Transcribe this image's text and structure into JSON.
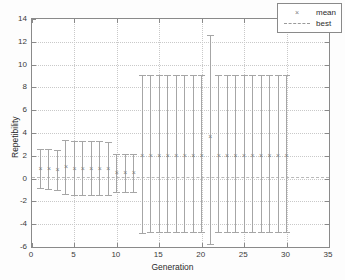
{
  "chart_data": {
    "type": "scatter",
    "title": "",
    "xlabel": "Generation",
    "ylabel": "Repetibility",
    "xlim": [
      0,
      35
    ],
    "ylim": [
      -6,
      14
    ],
    "xticks": [
      0,
      5,
      10,
      15,
      20,
      25,
      30,
      35
    ],
    "yticks": [
      -6,
      -4,
      -2,
      0,
      2,
      4,
      6,
      8,
      10,
      12,
      14
    ],
    "grid": true,
    "legend": {
      "position": "top-right",
      "entries": [
        {
          "label": "mean",
          "marker": "x",
          "style": "marker"
        },
        {
          "label": "best",
          "marker": "dashed-line",
          "style": "line"
        }
      ]
    },
    "series": [
      {
        "name": "mean",
        "marker": "x",
        "color": "#7d7d7d",
        "x": [
          1,
          2,
          3,
          4,
          5,
          6,
          7,
          8,
          9,
          10,
          11,
          12,
          13,
          14,
          15,
          16,
          17,
          18,
          19,
          20,
          21,
          22,
          23,
          24,
          25,
          26,
          27,
          28,
          29,
          30
        ],
        "values": [
          0.95,
          0.9,
          0.85,
          1.1,
          0.95,
          0.95,
          0.95,
          0.95,
          0.95,
          0.6,
          0.6,
          0.6,
          2.1,
          2.1,
          2.1,
          2.1,
          2.1,
          2.1,
          2.1,
          2.1,
          3.75,
          2.1,
          2.1,
          2.1,
          2.1,
          2.1,
          2.1,
          2.1,
          2.1,
          2.1
        ],
        "err_upper": [
          2.6,
          2.6,
          2.5,
          3.35,
          3.3,
          3.3,
          3.3,
          3.3,
          3.25,
          2.15,
          2.15,
          2.15,
          9.1,
          9.1,
          9.1,
          9.1,
          9.1,
          9.1,
          9.1,
          9.1,
          12.6,
          9.1,
          9.1,
          9.1,
          9.1,
          9.1,
          9.1,
          9.1,
          9.1,
          9.1
        ],
        "err_lower": [
          -0.85,
          -0.95,
          -1.0,
          -1.35,
          -1.4,
          -1.4,
          -1.4,
          -1.4,
          -1.4,
          -1.15,
          -1.15,
          -1.2,
          -4.75,
          -4.7,
          -4.7,
          -4.7,
          -4.7,
          -4.7,
          -4.7,
          -4.7,
          -5.7,
          -4.7,
          -4.7,
          -4.7,
          -4.7,
          -4.7,
          -4.7,
          -4.7,
          -4.7,
          -4.7
        ]
      },
      {
        "name": "best",
        "style": "dashed-line",
        "color": "#b9b9b9",
        "constant_value": 0.1
      }
    ]
  },
  "axes": {
    "x_title": "Generation",
    "y_title": "Repetibility",
    "x_tick_labels": [
      "0",
      "5",
      "10",
      "15",
      "20",
      "25",
      "30",
      "35"
    ],
    "y_tick_labels": [
      "-6",
      "-4",
      "-2",
      "0",
      "2",
      "4",
      "6",
      "8",
      "10",
      "12",
      "14"
    ]
  },
  "legend": {
    "mean_label": "mean",
    "mean_symbol": "×",
    "best_label": "best"
  },
  "colors": {
    "errorbar": "#a6a6a6",
    "marker": "#7d7d7d",
    "best_line": "#b9b9b9",
    "axis": "#8a8a8a",
    "grid": "#c9c9c9",
    "text": "#2b2b2b",
    "background": "#ffffff"
  }
}
